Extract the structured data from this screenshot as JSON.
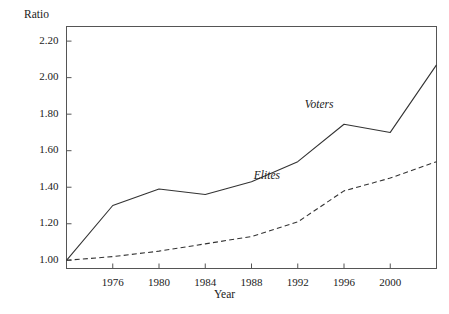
{
  "chart_data": {
    "type": "line",
    "title": "",
    "xlabel": "Year",
    "ylabel": "Ratio",
    "xlim": [
      1972,
      2004
    ],
    "ylim": [
      0.955,
      2.28
    ],
    "grid": false,
    "legend_position": "inline-annotations",
    "x_ticks": [
      1976,
      1980,
      1984,
      1988,
      1992,
      1996,
      2000
    ],
    "x_tick_labels": [
      "1976",
      "1980",
      "1984",
      "1988",
      "1992",
      "1996",
      "2000"
    ],
    "y_ticks": [
      1.0,
      1.2,
      1.4,
      1.6,
      1.8,
      2.0,
      2.2
    ],
    "y_tick_labels": [
      "1.00",
      "1.20",
      "1.40",
      "1.60",
      "1.80",
      "2.00",
      "2.20"
    ],
    "x": [
      1972,
      1976,
      1980,
      1984,
      1988,
      1992,
      1996,
      2000,
      2004
    ],
    "series": [
      {
        "name": "Voters",
        "style": "solid",
        "color": "#333333",
        "values": [
          1.0,
          1.3,
          1.39,
          1.36,
          1.43,
          1.54,
          1.745,
          1.7,
          2.07
        ],
        "label_x": 1992.6,
        "label_y": 1.845
      },
      {
        "name": "Elites",
        "style": "dashed",
        "color": "#333333",
        "values": [
          1.0,
          1.02,
          1.05,
          1.09,
          1.13,
          1.21,
          1.38,
          1.45,
          1.54
        ],
        "label_x": 1988.2,
        "label_y": 1.455
      }
    ],
    "annotations": [
      {
        "text": "Voters",
        "x": 1992.6,
        "y": 1.845
      },
      {
        "text": "Elites",
        "x": 1988.2,
        "y": 1.455
      }
    ],
    "axis_color": "#555555",
    "background": "#ffffff"
  }
}
